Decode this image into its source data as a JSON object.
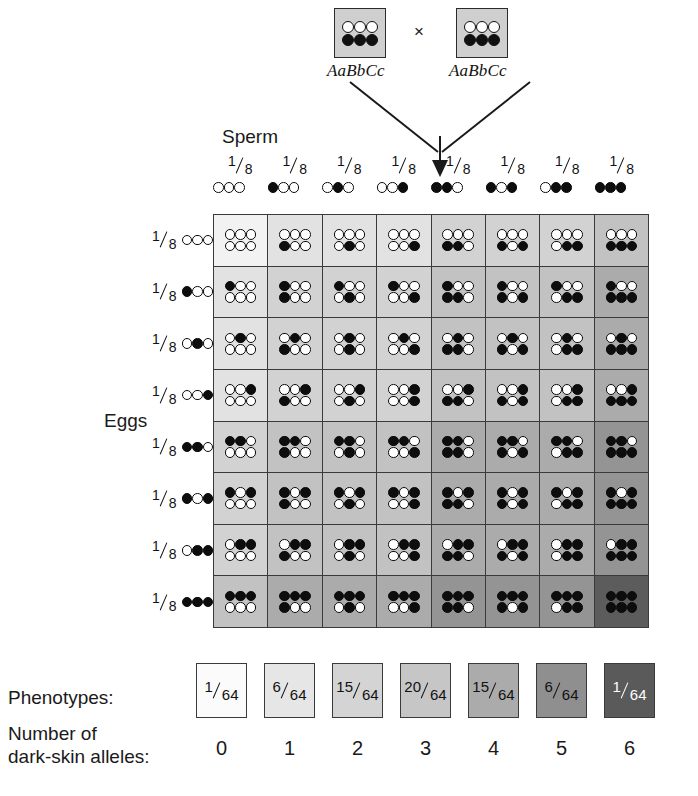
{
  "cross": {
    "male_genotype": "AaBbCc",
    "female_genotype": "AaBbCc",
    "cross_symbol": "×",
    "parent_alleles_top": [
      "light",
      "light",
      "light"
    ],
    "parent_alleles_bottom": [
      "dark",
      "dark",
      "dark"
    ],
    "parent_box_color": "#cfcfcf"
  },
  "headings": {
    "sperm": "Sperm",
    "eggs": "Eggs"
  },
  "gametes": {
    "frequency_numerator": "1",
    "frequency_denominator": "8",
    "sperm": [
      {
        "alleles": [
          "light",
          "light",
          "light"
        ],
        "dark_count": 0
      },
      {
        "alleles": [
          "dark",
          "light",
          "light"
        ],
        "dark_count": 1
      },
      {
        "alleles": [
          "light",
          "dark",
          "light"
        ],
        "dark_count": 1
      },
      {
        "alleles": [
          "light",
          "light",
          "dark"
        ],
        "dark_count": 1
      },
      {
        "alleles": [
          "dark",
          "dark",
          "light"
        ],
        "dark_count": 2
      },
      {
        "alleles": [
          "dark",
          "light",
          "dark"
        ],
        "dark_count": 2
      },
      {
        "alleles": [
          "light",
          "dark",
          "dark"
        ],
        "dark_count": 2
      },
      {
        "alleles": [
          "dark",
          "dark",
          "dark"
        ],
        "dark_count": 3
      }
    ],
    "eggs": [
      {
        "alleles": [
          "light",
          "light",
          "light"
        ],
        "dark_count": 0
      },
      {
        "alleles": [
          "dark",
          "light",
          "light"
        ],
        "dark_count": 1
      },
      {
        "alleles": [
          "light",
          "dark",
          "light"
        ],
        "dark_count": 1
      },
      {
        "alleles": [
          "light",
          "light",
          "dark"
        ],
        "dark_count": 1
      },
      {
        "alleles": [
          "dark",
          "dark",
          "light"
        ],
        "dark_count": 2
      },
      {
        "alleles": [
          "dark",
          "light",
          "dark"
        ],
        "dark_count": 2
      },
      {
        "alleles": [
          "light",
          "dark",
          "dark"
        ],
        "dark_count": 2
      },
      {
        "alleles": [
          "dark",
          "dark",
          "dark"
        ],
        "dark_count": 3
      }
    ]
  },
  "shade_scale": {
    "0": "#f2f2f2",
    "1": "#e2e2e2",
    "2": "#d2d2d2",
    "3": "#c2c2c2",
    "4": "#ababab",
    "5": "#949494",
    "6": "#5c5c5c"
  },
  "legend": {
    "phenotypes_label": "Phenotypes:",
    "alleles_label_line1": "Number of",
    "alleles_label_line2": "dark-skin alleles:",
    "swatches": [
      {
        "numerator": "1",
        "denominator": "64",
        "dark_alleles": "0",
        "shade": "#fbfbfb",
        "text_color": "#121212"
      },
      {
        "numerator": "6",
        "denominator": "64",
        "dark_alleles": "1",
        "shade": "#e6e6e6",
        "text_color": "#121212"
      },
      {
        "numerator": "15",
        "denominator": "64",
        "dark_alleles": "2",
        "shade": "#d4d4d4",
        "text_color": "#121212"
      },
      {
        "numerator": "20",
        "denominator": "64",
        "dark_alleles": "3",
        "shade": "#c6c6c6",
        "text_color": "#121212"
      },
      {
        "numerator": "15",
        "denominator": "64",
        "dark_alleles": "4",
        "shade": "#ababab",
        "text_color": "#121212"
      },
      {
        "numerator": "6",
        "denominator": "64",
        "dark_alleles": "5",
        "shade": "#8f8f8f",
        "text_color": "#121212"
      },
      {
        "numerator": "1",
        "denominator": "64",
        "dark_alleles": "6",
        "shade": "#5a5a5a",
        "text_color": "#ffffff"
      }
    ]
  },
  "chart_data": {
    "type": "table",
    "rows": 8,
    "columns": 8,
    "categories": [
      "0",
      "1",
      "2",
      "3",
      "4",
      "5",
      "6"
    ],
    "values": [
      1,
      6,
      15,
      20,
      15,
      6,
      1
    ],
    "xlabel": "Number of dark-skin alleles",
    "ylabel": "Number of offspring out of 64"
  }
}
